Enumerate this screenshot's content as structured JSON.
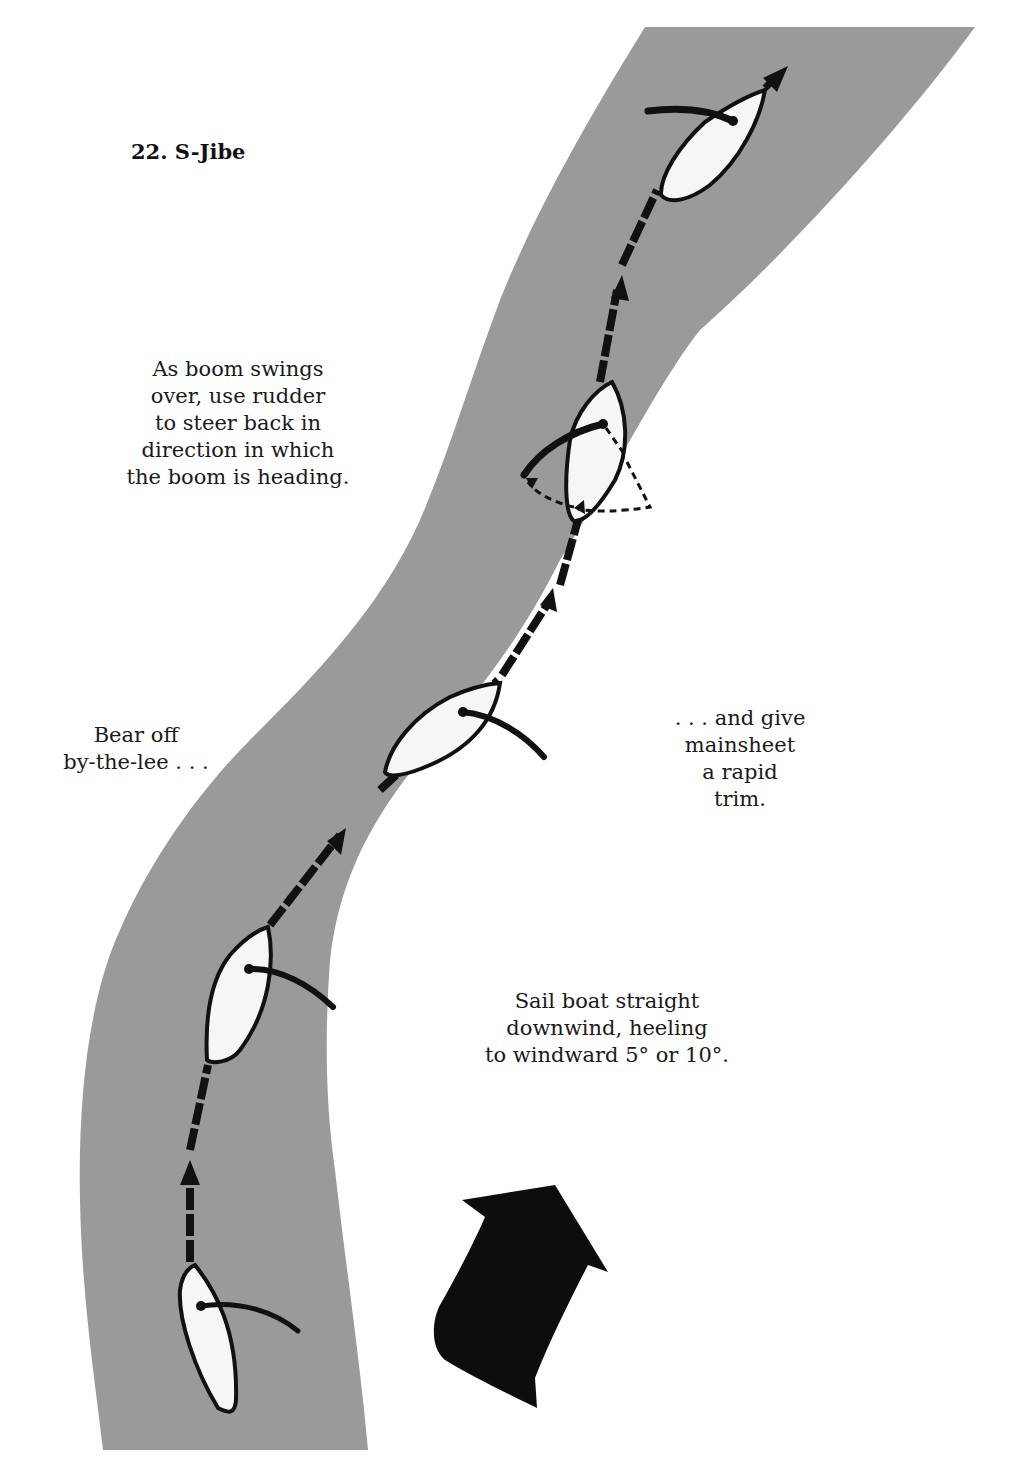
{
  "title": "22. S-Jibe",
  "colors": {
    "river": "#9a9a9a",
    "boat_fill": "#f6f6f6",
    "ink": "#111111",
    "background": "#ffffff"
  },
  "annotations": {
    "boom_swing": "As boom swings\nover, use rudder\nto steer back in\ndirection in which\nthe boom is heading.",
    "bear_off": "Bear off\nby-the-lee . . .",
    "mainsheet": ". . . and give\nmainsheet\na rapid\ntrim.",
    "sail_straight": "Sail boat straight\ndownwind, heeling\nto windward 5° or 10°."
  },
  "elements": {
    "wind_arrow": "wind-direction-arrow",
    "boats": [
      "boat-1-start",
      "boat-2-bear-off",
      "boat-3-trim",
      "boat-4-jibe",
      "boat-5-finish"
    ]
  }
}
